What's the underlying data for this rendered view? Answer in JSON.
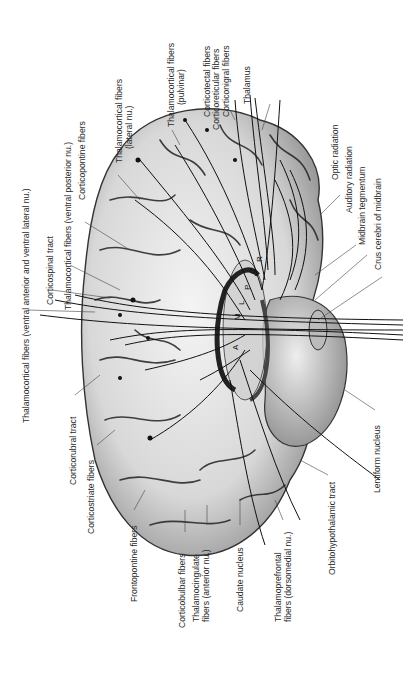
{
  "figure": {
    "internal_letters": [
      "A",
      "M",
      "L",
      "P",
      "R",
      "C"
    ],
    "labels": {
      "thal_va_vl": "Thalamocortical fibers (ventral anterior and ventral lateral nu.)",
      "corticospinal": "Corticospinal tract",
      "thal_vp": "Thalamocortical fibers (ventral posterior nu.)",
      "corticopontine": "Corticopontine fibers",
      "thal_lateral_1": "Thalamocortical fibers",
      "thal_lateral_2": "(lateral nu.)",
      "thal_pulvinar_1": "Thalamocortical fibers",
      "thal_pulvinar_2": "(pulvinar)",
      "corticotectal": "Corticotectal fibers",
      "corticoreticular": "Corticoreticular fibers",
      "corticonigral": "Corticonigral fibers",
      "thalamus": "Thalamus",
      "optic_radiation": "Optic radiation",
      "auditory_radiation": "Auditory radiation",
      "midbrain_tegmentum": "Midbrain tegmentum",
      "crus_cerebri": "Crus cerebri of midbrain",
      "corticorubral": "Corticorubral tract",
      "corticostriate": "Corticostriate fibers",
      "frontopontine": "Frontopontine fibers",
      "corticobulbar": "Corticobulbar fibers",
      "thal_cingulate_1": "Thalamocingulate",
      "thal_cingulate_2": "fibers (anterior nu.)",
      "caudate": "Caudate nucleus",
      "thal_prefrontal_1": "Thalamoprefrontal",
      "thal_prefrontal_2": "fibers (dorsomedial nu.)",
      "orbitohypothalamic": "Orbitohypothalamic tract",
      "lentiform": "Lentiform nucleus"
    }
  }
}
